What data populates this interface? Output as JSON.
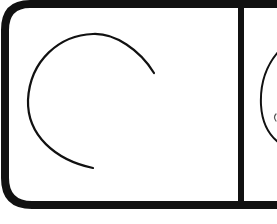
{
  "figure": {
    "colors": {
      "background": "#ffffff",
      "stroke": "#111111"
    },
    "panels": [
      {
        "id": "left-panel",
        "content": "open C-shaped arc"
      },
      {
        "id": "right-panel",
        "content": "partially visible arc with small mark (cropped)"
      }
    ]
  }
}
